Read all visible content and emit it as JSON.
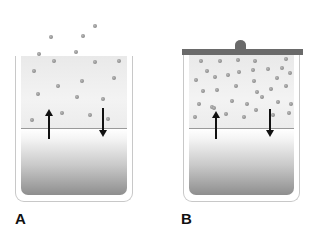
{
  "diagram": {
    "type": "evaporation-equilibrium",
    "panels": [
      {
        "id": "A",
        "label": "A",
        "container": "open",
        "lid": false,
        "arrows": [
          {
            "direction": "up",
            "meaning": "evaporation"
          },
          {
            "direction": "down",
            "meaning": "condensation"
          }
        ],
        "particles": [
          [
            95,
            26
          ],
          [
            83,
            36
          ],
          [
            51,
            37
          ],
          [
            76,
            52
          ],
          [
            39,
            54
          ],
          [
            54,
            61
          ],
          [
            95,
            62
          ],
          [
            119,
            61
          ],
          [
            34,
            71
          ],
          [
            114,
            78
          ],
          [
            82,
            81
          ],
          [
            58,
            86
          ],
          [
            38,
            94
          ],
          [
            77,
            97
          ],
          [
            103,
            99
          ],
          [
            62,
            113
          ],
          [
            90,
            115
          ],
          [
            108,
            119
          ],
          [
            32,
            120
          ]
        ]
      },
      {
        "id": "B",
        "label": "B",
        "container": "closed",
        "lid": true,
        "arrows": [
          {
            "direction": "up",
            "meaning": "evaporation"
          },
          {
            "direction": "down",
            "meaning": "condensation"
          }
        ],
        "particles": [
          [
            201,
            61
          ],
          [
            220,
            61
          ],
          [
            238,
            60
          ],
          [
            255,
            61
          ],
          [
            286,
            59
          ],
          [
            207,
            71
          ],
          [
            239,
            72
          ],
          [
            253,
            70
          ],
          [
            268,
            69
          ],
          [
            282,
            68
          ],
          [
            196,
            80
          ],
          [
            215,
            77
          ],
          [
            228,
            75
          ],
          [
            254,
            81
          ],
          [
            277,
            78
          ],
          [
            290,
            73
          ],
          [
            203,
            91
          ],
          [
            217,
            90
          ],
          [
            236,
            86
          ],
          [
            257,
            92
          ],
          [
            271,
            89
          ],
          [
            286,
            86
          ],
          [
            199,
            104
          ],
          [
            212,
            107
          ],
          [
            232,
            101
          ],
          [
            247,
            104
          ],
          [
            262,
            97
          ],
          [
            278,
            102
          ],
          [
            291,
            104
          ],
          [
            195,
            117
          ],
          [
            214,
            108
          ],
          [
            226,
            114
          ],
          [
            244,
            117
          ],
          [
            256,
            110
          ],
          [
            273,
            115
          ],
          [
            289,
            113
          ]
        ]
      }
    ]
  },
  "labels": {
    "panel_a": "A",
    "panel_b": "B"
  },
  "colors": {
    "lid": "#6a6a6a",
    "arrow": "#111111",
    "particle": "#8a8a8a",
    "liquid_dark": "#8e8e8e"
  }
}
